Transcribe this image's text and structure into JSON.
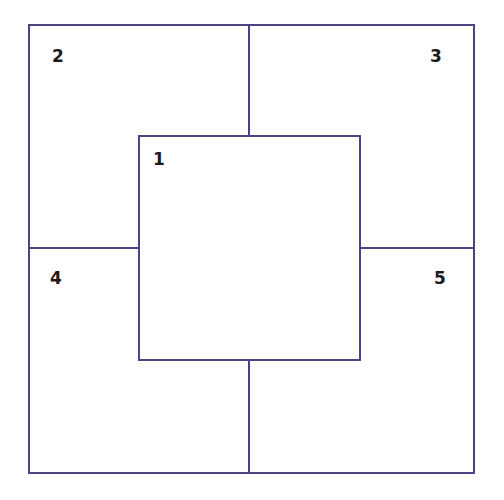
{
  "diagram": {
    "type": "nested-square-partition",
    "line_color": "#4b4383",
    "regions": [
      {
        "id": "1",
        "label": "1",
        "position": "center"
      },
      {
        "id": "2",
        "label": "2",
        "position": "top-left"
      },
      {
        "id": "3",
        "label": "3",
        "position": "top-right"
      },
      {
        "id": "4",
        "label": "4",
        "position": "bottom-left"
      },
      {
        "id": "5",
        "label": "5",
        "position": "bottom-right"
      }
    ]
  }
}
